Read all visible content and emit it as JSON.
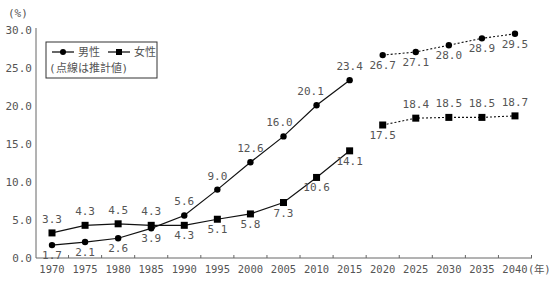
{
  "chart_data": {
    "type": "line",
    "title": "",
    "xlabel": "(年)",
    "ylabel": "(%)",
    "ylim": [
      0,
      30
    ],
    "yticks": [
      "0.0",
      "5.0",
      "10.0",
      "15.0",
      "20.0",
      "25.0",
      "30.0"
    ],
    "categories": [
      "1970",
      "1975",
      "1980",
      "1985",
      "1990",
      "1995",
      "2000",
      "2005",
      "2010",
      "2015",
      "2020",
      "2025",
      "2030",
      "2035",
      "2040"
    ],
    "grid": false,
    "legend_position": "top-left",
    "legend_note": "(点線は推計値)",
    "series": [
      {
        "name": "男性",
        "marker": "circle",
        "actual": {
          "x": [
            "1970",
            "1975",
            "1980",
            "1985",
            "1990",
            "1995",
            "2000",
            "2005",
            "2010",
            "2015"
          ],
          "values": [
            1.7,
            2.1,
            2.6,
            3.9,
            5.6,
            9.0,
            12.6,
            16.0,
            20.1,
            23.4
          ],
          "labels": [
            "1.7",
            "2.1",
            "2.6",
            "3.9",
            "5.6",
            "9.0",
            "12.6",
            "16.0",
            "20.1",
            "23.4"
          ]
        },
        "projected": {
          "x": [
            "2020",
            "2025",
            "2030",
            "2035",
            "2040"
          ],
          "values": [
            26.7,
            27.1,
            28.0,
            28.9,
            29.5
          ],
          "labels": [
            "26.7",
            "27.1",
            "28.0",
            "28.9",
            "29.5"
          ]
        }
      },
      {
        "name": "女性",
        "marker": "square",
        "actual": {
          "x": [
            "1970",
            "1975",
            "1980",
            "1985",
            "1990",
            "1995",
            "2000",
            "2005",
            "2010",
            "2015"
          ],
          "values": [
            3.3,
            4.3,
            4.5,
            4.3,
            4.3,
            5.1,
            5.8,
            7.3,
            10.6,
            14.1
          ],
          "labels": [
            "3.3",
            "4.3",
            "4.5",
            "4.3",
            "4.3",
            "5.1",
            "5.8",
            "7.3",
            "10.6",
            "14.1"
          ]
        },
        "projected": {
          "x": [
            "2020",
            "2025",
            "2030",
            "2035",
            "2040"
          ],
          "values": [
            17.5,
            18.4,
            18.5,
            18.5,
            18.7
          ],
          "labels": [
            "17.5",
            "18.4",
            "18.5",
            "18.5",
            "18.7"
          ]
        }
      }
    ]
  },
  "legend": {
    "male_label": "男性",
    "female_label": "女性",
    "note": "(点線は推計値)"
  },
  "axis": {
    "y_unit": "(%)",
    "x_unit": "(年)"
  }
}
